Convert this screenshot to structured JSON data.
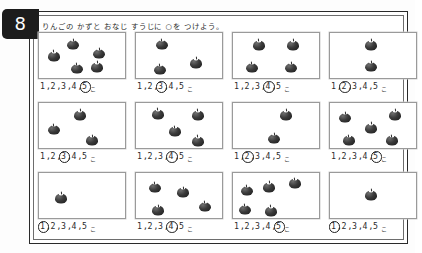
{
  "worksheet": {
    "page_number": "8",
    "instruction": "りんごの かずと おなじ すうじに ○を つけよう。",
    "choice_numbers": [
      "1",
      "2",
      "3",
      "4",
      "5"
    ],
    "separator": ",",
    "trailing_mark": "こ"
  },
  "chart_data": {
    "type": "table",
    "title": "りんごの かずと おなじ すうじに ○を つけよう。",
    "categories": [
      "1",
      "2",
      "3",
      "4",
      "5",
      "6",
      "7",
      "8",
      "9",
      "10",
      "11",
      "12"
    ],
    "values": [
      5,
      3,
      4,
      2,
      3,
      4,
      2,
      5,
      1,
      4,
      5,
      1
    ],
    "xlabel": "もんだい",
    "ylabel": "りんごの かず",
    "ylim": [
      0,
      5
    ]
  },
  "problems": [
    {
      "id": "problem-1",
      "apple_count": 5,
      "circled_number": "5",
      "apples": [
        {
          "x": 17,
          "y": 50
        },
        {
          "x": 40,
          "y": 25
        },
        {
          "x": 70,
          "y": 45
        },
        {
          "x": 44,
          "y": 78
        },
        {
          "x": 68,
          "y": 75
        }
      ]
    },
    {
      "id": "problem-2",
      "apple_count": 3,
      "circled_number": "3",
      "apples": [
        {
          "x": 30,
          "y": 25
        },
        {
          "x": 70,
          "y": 66
        },
        {
          "x": 28,
          "y": 80
        }
      ]
    },
    {
      "id": "problem-3",
      "apple_count": 4,
      "circled_number": "4",
      "apples": [
        {
          "x": 30,
          "y": 26
        },
        {
          "x": 70,
          "y": 26
        },
        {
          "x": 22,
          "y": 76
        },
        {
          "x": 68,
          "y": 76
        }
      ]
    },
    {
      "id": "problem-4",
      "apple_count": 2,
      "circled_number": "2",
      "apples": [
        {
          "x": 48,
          "y": 26
        },
        {
          "x": 48,
          "y": 74
        }
      ]
    },
    {
      "id": "problem-5",
      "apple_count": 3,
      "circled_number": "3",
      "apples": [
        {
          "x": 48,
          "y": 26
        },
        {
          "x": 17,
          "y": 58
        },
        {
          "x": 62,
          "y": 82
        }
      ]
    },
    {
      "id": "problem-6",
      "apple_count": 4,
      "circled_number": "4",
      "apples": [
        {
          "x": 25,
          "y": 24
        },
        {
          "x": 72,
          "y": 26
        },
        {
          "x": 45,
          "y": 62
        },
        {
          "x": 72,
          "y": 84
        }
      ]
    },
    {
      "id": "problem-7",
      "apple_count": 2,
      "circled_number": "2",
      "apples": [
        {
          "x": 62,
          "y": 26
        },
        {
          "x": 48,
          "y": 78
        }
      ]
    },
    {
      "id": "problem-8",
      "apple_count": 5,
      "circled_number": "5",
      "apples": [
        {
          "x": 18,
          "y": 32
        },
        {
          "x": 76,
          "y": 26
        },
        {
          "x": 48,
          "y": 55
        },
        {
          "x": 22,
          "y": 82
        },
        {
          "x": 72,
          "y": 82
        }
      ]
    },
    {
      "id": "problem-9",
      "apple_count": 1,
      "circled_number": "1",
      "apples": [
        {
          "x": 26,
          "y": 55
        }
      ]
    },
    {
      "id": "problem-10",
      "apple_count": 4,
      "circled_number": "4",
      "apples": [
        {
          "x": 22,
          "y": 32
        },
        {
          "x": 55,
          "y": 42
        },
        {
          "x": 26,
          "y": 82
        },
        {
          "x": 80,
          "y": 74
        }
      ]
    },
    {
      "id": "problem-11",
      "apple_count": 5,
      "circled_number": "5",
      "apples": [
        {
          "x": 16,
          "y": 38
        },
        {
          "x": 42,
          "y": 30
        },
        {
          "x": 72,
          "y": 22
        },
        {
          "x": 14,
          "y": 80
        },
        {
          "x": 44,
          "y": 84
        }
      ]
    },
    {
      "id": "problem-12",
      "apple_count": 1,
      "circled_number": "1",
      "apples": [
        {
          "x": 48,
          "y": 48
        }
      ]
    }
  ]
}
